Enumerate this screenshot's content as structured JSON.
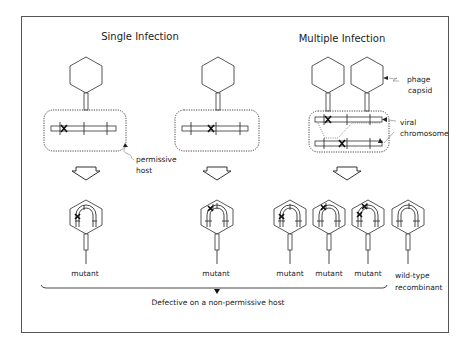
{
  "diagram": {
    "titles": {
      "single": "Single Infection",
      "multiple": "Multiple Infection"
    },
    "labels": {
      "phage_capsid_line1": "phage",
      "phage_capsid_line2": "capsid",
      "viral_chromosome_line1": "viral",
      "viral_chromosome_line2": "chromosome",
      "permissive_host_line1": "permissive",
      "permissive_host_line2": "host"
    },
    "progeny": [
      {
        "label": "mutant",
        "panel": "single-1"
      },
      {
        "label": "mutant",
        "panel": "single-2"
      },
      {
        "label": "mutant",
        "panel": "multiple"
      },
      {
        "label": "mutant",
        "panel": "multiple"
      },
      {
        "label": "mutant",
        "panel": "multiple"
      },
      {
        "label_line1": "wild-type",
        "label_line2": "recombinant",
        "panel": "multiple"
      }
    ],
    "bracket_caption": "Defective on a non-permissive host"
  }
}
